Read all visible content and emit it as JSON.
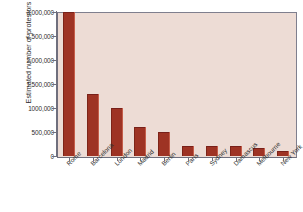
{
  "chart_data": {
    "type": "bar",
    "title": "",
    "xlabel": "",
    "ylabel": "Estimated number of protestors",
    "categories": [
      "Rome",
      "Barcelona",
      "London",
      "Madrid",
      "Berlin",
      "Paris",
      "Sydney",
      "Damascus",
      "Melbourne",
      "New York"
    ],
    "values": [
      3000000,
      1300000,
      1000000,
      600000,
      500000,
      200000,
      200000,
      200000,
      170000,
      110000
    ],
    "ylim": [
      0,
      3000000
    ],
    "ytick_values": [
      0,
      500000,
      1000000,
      1500000,
      2000000,
      2500000,
      3000000
    ],
    "ytick_labels": [
      "0",
      "500,000",
      "1000,000",
      "1,500,000",
      "2,000,000",
      "2,500,000",
      "3,000,000"
    ],
    "grid": false,
    "legend": false,
    "bar_color": "#9e3324",
    "plot_background": "#eddcd5",
    "figure_background": "#ffffff",
    "axis_color": "#6f6f7d",
    "text_color": "#2b2b2b"
  }
}
